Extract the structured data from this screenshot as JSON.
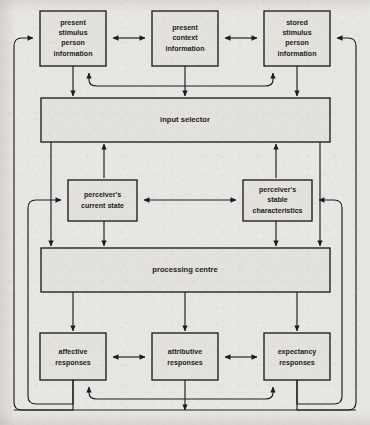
{
  "diagram": {
    "background_color": "#e8e6e2",
    "box_fill_color": "#e3e1dc",
    "line_color": "#1c1c1c",
    "nodes": [
      {
        "id": "present-stimulus-person-information",
        "label": "present\nstimulus\nperson\ninformation",
        "lines": [
          "present",
          "stimulus",
          "person",
          "information"
        ],
        "x": 40,
        "y": 11,
        "w": 66,
        "h": 55
      },
      {
        "id": "present-context-information",
        "label": "present\ncontext\ninformation",
        "lines": [
          "present",
          "context",
          "information"
        ],
        "x": 152,
        "y": 11,
        "w": 66,
        "h": 55
      },
      {
        "id": "stored-stimulus-person-information",
        "label": "stored\nstimulus\nperson\ninformation",
        "lines": [
          "stored",
          "stimulus",
          "person",
          "information"
        ],
        "x": 264,
        "y": 11,
        "w": 66,
        "h": 55
      },
      {
        "id": "input-selector",
        "label": "input selector",
        "lines": [
          "input selector"
        ],
        "x": 41,
        "y": 98,
        "w": 289,
        "h": 44
      },
      {
        "id": "perceivers-current-state",
        "label": "perceiver's\ncurrent state",
        "lines": [
          "perceiver's",
          "current state"
        ],
        "x": 68,
        "y": 180,
        "w": 69,
        "h": 41
      },
      {
        "id": "perceivers-stable-characteristics",
        "label": "perceiver's\nstable\ncharacteristics",
        "lines": [
          "perceiver's",
          "stable",
          "characteristics"
        ],
        "x": 243,
        "y": 180,
        "w": 69,
        "h": 41
      },
      {
        "id": "processing-centre",
        "label": "processing centre",
        "lines": [
          "processing centre"
        ],
        "x": 41,
        "y": 248,
        "w": 289,
        "h": 44
      },
      {
        "id": "affective-responses",
        "label": "affective\nresponses",
        "lines": [
          "affective",
          "responses"
        ],
        "x": 40,
        "y": 333,
        "w": 66,
        "h": 47
      },
      {
        "id": "attributive-responses",
        "label": "attributive\nresponses",
        "lines": [
          "attributive",
          "responses"
        ],
        "x": 152,
        "y": 333,
        "w": 66,
        "h": 47
      },
      {
        "id": "expectancy-responses",
        "label": "expectancy\nresponses",
        "lines": [
          "expectancy",
          "responses"
        ],
        "x": 264,
        "y": 333,
        "w": 66,
        "h": 47
      }
    ],
    "connections": [
      {
        "id": "stimulus-to-context",
        "from": "present-stimulus-person-information",
        "to": "present-context-information",
        "kind": "bidirectional"
      },
      {
        "id": "context-to-stored",
        "from": "present-context-information",
        "to": "stored-stimulus-person-information",
        "kind": "bidirectional"
      },
      {
        "id": "stimulus-arc-stored",
        "from": "present-stimulus-person-information",
        "to": "stored-stimulus-person-information",
        "kind": "bidirectional-arc"
      },
      {
        "id": "stimulus-to-input-selector",
        "from": "present-stimulus-person-information",
        "to": "input-selector",
        "kind": "directed"
      },
      {
        "id": "context-to-input-selector",
        "from": "present-context-information",
        "to": "input-selector",
        "kind": "directed"
      },
      {
        "id": "stored-to-input-selector",
        "from": "stored-stimulus-person-information",
        "to": "input-selector",
        "kind": "directed"
      },
      {
        "id": "input-selector-to-current-state",
        "from": "input-selector",
        "to": "perceivers-current-state",
        "kind": "bidirectional"
      },
      {
        "id": "input-selector-to-stable-characteristics",
        "from": "input-selector",
        "to": "perceivers-stable-characteristics",
        "kind": "bidirectional"
      },
      {
        "id": "current-state-to-stable-characteristics",
        "from": "perceivers-current-state",
        "to": "perceivers-stable-characteristics",
        "kind": "bidirectional"
      },
      {
        "id": "input-selector-to-processing-centre-left",
        "from": "input-selector",
        "to": "processing-centre",
        "kind": "directed"
      },
      {
        "id": "input-selector-to-processing-centre-right",
        "from": "input-selector",
        "to": "processing-centre",
        "kind": "directed"
      },
      {
        "id": "current-state-to-processing-centre",
        "from": "perceivers-current-state",
        "to": "processing-centre",
        "kind": "directed"
      },
      {
        "id": "stable-characteristics-to-processing-centre",
        "from": "perceivers-stable-characteristics",
        "to": "processing-centre",
        "kind": "directed"
      },
      {
        "id": "processing-centre-to-affective",
        "from": "processing-centre",
        "to": "affective-responses",
        "kind": "directed"
      },
      {
        "id": "processing-centre-to-attributive",
        "from": "processing-centre",
        "to": "attributive-responses",
        "kind": "directed"
      },
      {
        "id": "processing-centre-to-expectancy",
        "from": "processing-centre",
        "to": "expectancy-responses",
        "kind": "directed"
      },
      {
        "id": "affective-to-attributive",
        "from": "affective-responses",
        "to": "attributive-responses",
        "kind": "bidirectional"
      },
      {
        "id": "attributive-to-expectancy",
        "from": "attributive-responses",
        "to": "expectancy-responses",
        "kind": "bidirectional"
      },
      {
        "id": "affective-arc-expectancy",
        "from": "affective-responses",
        "to": "expectancy-responses",
        "kind": "bidirectional-arc"
      },
      {
        "id": "responses-feedback-outer-left",
        "from": "affective-responses",
        "to": "present-stimulus-person-information",
        "kind": "feedback-loop"
      },
      {
        "id": "responses-feedback-inner-left",
        "from": "affective-responses",
        "to": "perceivers-current-state",
        "kind": "feedback-loop"
      },
      {
        "id": "responses-feedback-outer-right",
        "from": "expectancy-responses",
        "to": "stored-stimulus-person-information",
        "kind": "feedback-loop"
      },
      {
        "id": "responses-feedback-inner-right",
        "from": "expectancy-responses",
        "to": "perceivers-stable-characteristics",
        "kind": "feedback-loop"
      }
    ]
  }
}
